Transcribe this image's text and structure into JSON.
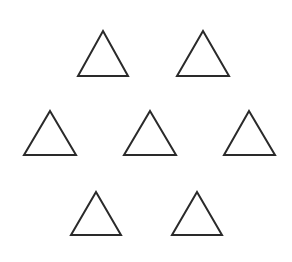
{
  "diagram": {
    "type": "shape-arrangement",
    "background": "#ffffff",
    "stroke_color": "#2a2a2a",
    "stroke_width": 2,
    "shape": "triangle-outline",
    "count": 7,
    "rows": [
      {
        "row": 1,
        "count": 2
      },
      {
        "row": 2,
        "count": 3
      },
      {
        "row": 3,
        "count": 2
      }
    ],
    "triangles": [
      {
        "id": 1,
        "apex": [
          103,
          31
        ],
        "base_left": [
          78,
          76
        ],
        "base_right": [
          128,
          76
        ]
      },
      {
        "id": 2,
        "apex": [
          203,
          31
        ],
        "base_left": [
          177,
          76
        ],
        "base_right": [
          229,
          76
        ]
      },
      {
        "id": 3,
        "apex": [
          50,
          111
        ],
        "base_left": [
          24,
          155
        ],
        "base_right": [
          76,
          155
        ]
      },
      {
        "id": 4,
        "apex": [
          150,
          111
        ],
        "base_left": [
          124,
          155
        ],
        "base_right": [
          176,
          155
        ]
      },
      {
        "id": 5,
        "apex": [
          249,
          111
        ],
        "base_left": [
          224,
          155
        ],
        "base_right": [
          275,
          155
        ]
      },
      {
        "id": 6,
        "apex": [
          96,
          192
        ],
        "base_left": [
          71,
          235
        ],
        "base_right": [
          121,
          235
        ]
      },
      {
        "id": 7,
        "apex": [
          197,
          192
        ],
        "base_left": [
          172,
          235
        ],
        "base_right": [
          222,
          235
        ]
      }
    ]
  }
}
